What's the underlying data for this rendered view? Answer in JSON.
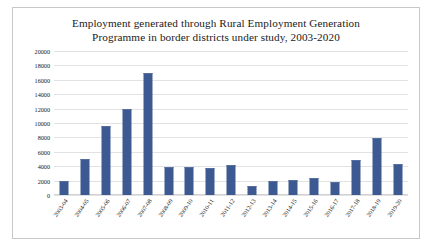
{
  "chart_data": {
    "type": "bar",
    "title": "Employment generated through Rural Employment Generation Programme in border districts under study, 2003-2020",
    "title_line1": "Employment generated through Rural Employment Generation",
    "title_line2": "Programme in border districts under study, 2003-2020",
    "xlabel": "",
    "ylabel": "",
    "ylim": [
      0,
      20000
    ],
    "ytick_step": 2000,
    "yticks": [
      20000,
      18000,
      16000,
      14000,
      12000,
      10000,
      8000,
      6000,
      4000,
      2000,
      0
    ],
    "ytick_labels": [
      "20000",
      "18000",
      "16000",
      "14000",
      "12000",
      "10000",
      "8000",
      "6000",
      "4000",
      "2000",
      "0"
    ],
    "grid": true,
    "legend": false,
    "legend_position": "none",
    "bar_color": "#3c5a91",
    "categories": [
      "2003-04",
      "2004-05",
      "2005-06",
      "2006-07",
      "2007-08",
      "2008-09",
      "2009-10",
      "2010-11",
      "2011-12",
      "2012-13",
      "2013-14",
      "2014-15",
      "2015-16",
      "2016-17",
      "2017-18",
      "2018-19",
      "2019-20"
    ],
    "values": [
      2000,
      5000,
      9600,
      11900,
      17000,
      3900,
      3900,
      3800,
      4100,
      1200,
      2000,
      2100,
      2300,
      1800,
      4800,
      7900,
      4300
    ]
  }
}
